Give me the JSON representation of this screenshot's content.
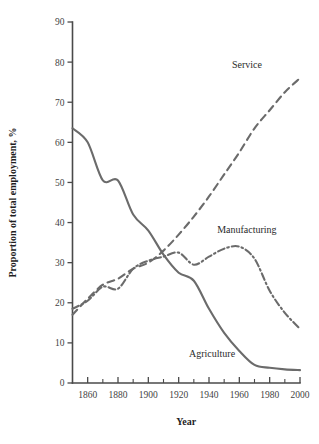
{
  "chart_data": {
    "type": "line",
    "title": "",
    "xlabel": "Year",
    "ylabel": "Proportion of total employment, %",
    "xlim": [
      1850,
      2000
    ],
    "ylim": [
      0,
      90
    ],
    "grid": false,
    "legend_position": "inline-annotations",
    "y_ticks": [
      0,
      10,
      20,
      30,
      40,
      50,
      60,
      70,
      80,
      90
    ],
    "y_tick_labels": [
      "0",
      "10",
      "20",
      "30",
      "40",
      "50",
      "60",
      "70",
      "80",
      "90"
    ],
    "x_ticks": [
      1860,
      1880,
      1900,
      1920,
      1940,
      1960,
      1980,
      2000
    ],
    "x_tick_labels": [
      "1860",
      "1880",
      "1900",
      "1920",
      "1940",
      "1960",
      "1980",
      "2000"
    ],
    "x_minor_ticks": [
      1850,
      1870,
      1890,
      1910,
      1930,
      1950,
      1970,
      1990
    ],
    "x": [
      1850,
      1860,
      1870,
      1880,
      1890,
      1900,
      1910,
      1920,
      1930,
      1940,
      1950,
      1960,
      1970,
      1980,
      1990,
      2000
    ],
    "series": [
      {
        "name": "Agriculture",
        "style": "solid",
        "color": "#6b6b6b",
        "label_x": 1942,
        "label_y": 6.5,
        "values": [
          63.5,
          60.0,
          50.5,
          50.5,
          42.0,
          38.0,
          32.0,
          27.5,
          25.5,
          18.5,
          12.5,
          8.0,
          4.5,
          3.8,
          3.4,
          3.2
        ]
      },
      {
        "name": "Service",
        "style": "dashed",
        "color": "#6b6b6b",
        "label_x": 1965,
        "label_y": 78.5,
        "values": [
          17.0,
          21.0,
          24.5,
          26.0,
          28.5,
          30.0,
          33.0,
          37.0,
          41.5,
          46.5,
          52.0,
          57.5,
          63.5,
          68.0,
          72.5,
          76.0
        ]
      },
      {
        "name": "Manufacturing",
        "style": "dashdot",
        "color": "#6b6b6b",
        "label_x": 1965,
        "label_y": 37.5,
        "values": [
          18.5,
          20.5,
          24.0,
          23.5,
          28.5,
          30.5,
          31.5,
          32.5,
          29.5,
          31.5,
          33.5,
          34.0,
          31.0,
          23.0,
          17.5,
          13.5
        ]
      }
    ]
  },
  "axes": {
    "y_title": "Proportion of total employment, %",
    "x_title": "Year"
  }
}
